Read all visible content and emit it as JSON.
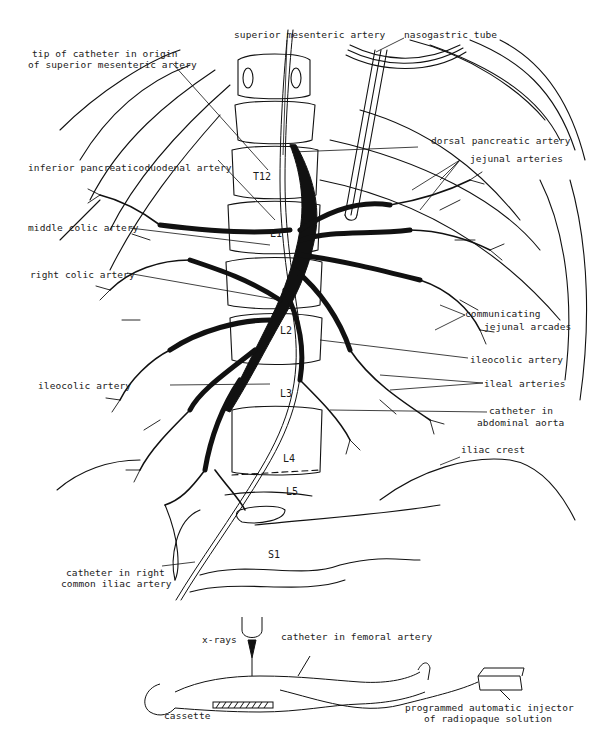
{
  "diagram": {
    "labels": {
      "superior_mesenteric_artery": "superior mesenteric artery",
      "nasogastric_tube": "nasogastric tube",
      "tip_of_catheter_line1": "tip of catheter in origin",
      "tip_of_catheter_line2": "of superior mesenteric artery",
      "dorsal_pancreatic_artery": "dorsal pancreatic artery",
      "jejunal_arteries": "jejunal arteries",
      "inferior_pancreaticoduodenal_artery": "inferior pancreaticoduodenal artery",
      "middle_colic_artery": "middle colic artery",
      "right_colic_artery": "right colic artery",
      "communicating_line1": "communicating",
      "communicating_line2": "jejunal arcades",
      "ileocolic_artery_right": "ileocolic artery",
      "ileocolic_artery_left": "ileocolic artery",
      "ileal_arteries": "ileal arteries",
      "catheter_aorta_line1": "catheter in",
      "catheter_aorta_line2": "abdominal aorta",
      "iliac_crest": "iliac crest",
      "catheter_iliac_line1": "catheter in right",
      "catheter_iliac_line2": "common iliac artery"
    },
    "vertebrae": {
      "t12": "T12",
      "l1": "L1",
      "l2": "L2",
      "l3": "L3",
      "l4": "L4",
      "l5": "L5",
      "s1": "S1"
    },
    "patient_setup": {
      "xrays": "x-rays",
      "catheter_femoral": "catheter in femoral artery",
      "cassette": "cassette",
      "injector_line1": "programmed automatic injector",
      "injector_line2": "of radiopaque solution"
    }
  }
}
